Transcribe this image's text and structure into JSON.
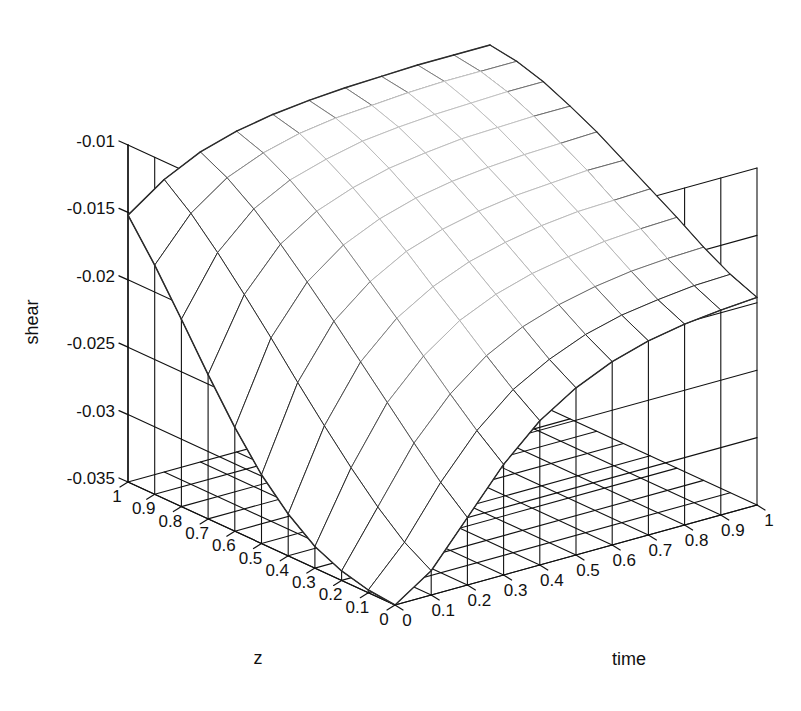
{
  "figure": {
    "kind": "3d-surface-plot",
    "background_color": "#ffffff",
    "line_color": "#111111",
    "mesh_color_near": "#2b2b2b",
    "mesh_color_far": "#c9c9c9",
    "width": 801,
    "height": 711
  },
  "axes": {
    "x": {
      "name": "time",
      "label": "time",
      "ticks": [
        "0",
        "0.1",
        "0.2",
        "0.3",
        "0.4",
        "0.5",
        "0.6",
        "0.7",
        "0.8",
        "0.9",
        "1"
      ],
      "values": [
        0,
        0.1,
        0.2,
        0.3,
        0.4,
        0.5,
        0.6,
        0.7,
        0.8,
        0.9,
        1
      ],
      "range": [
        0,
        1
      ]
    },
    "y": {
      "name": "z",
      "label": "z",
      "ticks": [
        "1",
        "0.9",
        "0.8",
        "0.7",
        "0.6",
        "0.5",
        "0.4",
        "0.3",
        "0.2",
        "0.1",
        "0"
      ],
      "values": [
        1,
        0.9,
        0.8,
        0.7,
        0.6,
        0.5,
        0.4,
        0.3,
        0.2,
        0.1,
        0
      ],
      "range": [
        0,
        1
      ]
    },
    "z": {
      "name": "shear",
      "label": "shear",
      "ticks": [
        "-0.01",
        "-0.015",
        "-0.02",
        "-0.025",
        "-0.03",
        "-0.035"
      ],
      "values": [
        -0.01,
        -0.015,
        -0.02,
        -0.025,
        -0.03,
        -0.035
      ],
      "range": [
        -0.035,
        -0.01
      ]
    }
  },
  "chart_data": {
    "type": "surface",
    "title": "",
    "xlabel": "time",
    "ylabel": "z",
    "zlabel": "shear",
    "xlim": [
      0,
      1
    ],
    "ylim": [
      0,
      1
    ],
    "zlim": [
      -0.035,
      -0.01
    ],
    "x": [
      0,
      0.1,
      0.2,
      0.3,
      0.4,
      0.5,
      0.6,
      0.7,
      0.8,
      0.9,
      1
    ],
    "y": [
      0,
      0.1,
      0.2,
      0.3,
      0.4,
      0.5,
      0.6,
      0.7,
      0.8,
      0.9,
      1
    ],
    "grid": true,
    "legend": "none",
    "note": "z[row=y index][col=x index]; shear values, surface high (~-0.012) along back/left, dropping steeply to ~-0.035 at small time and small z",
    "values": [
      [
        -0.035,
        -0.0332,
        -0.03,
        -0.0268,
        -0.0243,
        -0.0226,
        -0.0214,
        -0.0206,
        -0.0201,
        -0.0198,
        -0.0196
      ],
      [
        -0.0348,
        -0.032,
        -0.0283,
        -0.0252,
        -0.0229,
        -0.0214,
        -0.0203,
        -0.0196,
        -0.0192,
        -0.0189,
        -0.0188
      ],
      [
        -0.0343,
        -0.0303,
        -0.0263,
        -0.0234,
        -0.0213,
        -0.0199,
        -0.019,
        -0.0184,
        -0.018,
        -0.0178,
        -0.0177
      ],
      [
        -0.0334,
        -0.0283,
        -0.0242,
        -0.0215,
        -0.0196,
        -0.0184,
        -0.0176,
        -0.0171,
        -0.0167,
        -0.0165,
        -0.0164
      ],
      [
        -0.0319,
        -0.0261,
        -0.0221,
        -0.0196,
        -0.018,
        -0.0169,
        -0.0162,
        -0.0157,
        -0.0154,
        -0.0153,
        -0.0152
      ],
      [
        -0.0299,
        -0.0238,
        -0.02,
        -0.0178,
        -0.0163,
        -0.0154,
        -0.0148,
        -0.0144,
        -0.0142,
        -0.014,
        -0.014
      ],
      [
        -0.0273,
        -0.0214,
        -0.018,
        -0.016,
        -0.0148,
        -0.014,
        -0.0135,
        -0.0132,
        -0.013,
        -0.0129,
        -0.0128
      ],
      [
        -0.0243,
        -0.0191,
        -0.0161,
        -0.0144,
        -0.0134,
        -0.0127,
        -0.0123,
        -0.012,
        -0.0119,
        -0.0118,
        -0.0118
      ],
      [
        -0.0211,
        -0.0169,
        -0.0144,
        -0.013,
        -0.0122,
        -0.0116,
        -0.0113,
        -0.0111,
        -0.011,
        -0.0109,
        -0.0109
      ],
      [
        -0.018,
        -0.0149,
        -0.013,
        -0.0119,
        -0.0112,
        -0.0108,
        -0.0106,
        -0.0104,
        -0.0103,
        -0.0103,
        -0.0103
      ],
      [
        -0.0152,
        -0.0133,
        -0.012,
        -0.0112,
        -0.0107,
        -0.0104,
        -0.0102,
        -0.0101,
        -0.01,
        -0.01,
        -0.01
      ]
    ]
  },
  "projection": {
    "origin_screen": [
      395,
      605
    ],
    "left_corner_screen": [
      128,
      482
    ],
    "right_corner_screen": [
      757,
      505
    ],
    "back_corner_screen": [
      485,
      370
    ],
    "axis_top_screen": [
      128,
      145
    ],
    "z_pixel_height": 337
  }
}
